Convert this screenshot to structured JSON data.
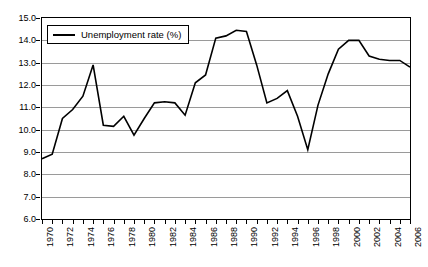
{
  "chart_data": {
    "type": "line",
    "title": "",
    "xlabel": "",
    "ylabel": "",
    "grid": true,
    "legend_position": "top-left",
    "xlim": [
      1970,
      2006
    ],
    "ylim": [
      6.0,
      15.0
    ],
    "ytick_labels": [
      "15.0",
      "14.0",
      "13.0",
      "12.0",
      "11.0",
      "10.0",
      "9.0",
      "8.0",
      "7.0",
      "6.0"
    ],
    "ytick_values": [
      15.0,
      14.0,
      13.0,
      12.0,
      11.0,
      10.0,
      9.0,
      8.0,
      7.0,
      6.0
    ],
    "xtick_labels": [
      "1970",
      "1972",
      "1974",
      "1976",
      "1978",
      "1980",
      "1982",
      "1984",
      "1986",
      "1988",
      "1990",
      "1992",
      "1994",
      "1996",
      "1998",
      "2000",
      "2002",
      "2004",
      "2006"
    ],
    "xtick_values": [
      1970,
      1972,
      1974,
      1976,
      1978,
      1980,
      1982,
      1984,
      1986,
      1988,
      1990,
      1992,
      1994,
      1996,
      1998,
      2000,
      2002,
      2004,
      2006
    ],
    "x": [
      1970,
      1971,
      1972,
      1973,
      1974,
      1975,
      1976,
      1977,
      1978,
      1979,
      1980,
      1981,
      1982,
      1983,
      1984,
      1985,
      1986,
      1987,
      1988,
      1989,
      1990,
      1991,
      1992,
      1993,
      1994,
      1995,
      1996,
      1997,
      1998,
      1999,
      2000,
      2001,
      2002,
      2003,
      2004,
      2005,
      2006
    ],
    "series": [
      {
        "name": "Unemployment rate (%)",
        "color": "#000000",
        "values": [
          8.7,
          8.9,
          10.5,
          10.9,
          11.5,
          12.9,
          10.2,
          10.15,
          10.6,
          9.75,
          10.5,
          11.2,
          11.25,
          11.2,
          10.65,
          12.1,
          12.45,
          14.1,
          14.2,
          14.45,
          14.4,
          12.9,
          11.2,
          11.4,
          11.75,
          10.6,
          9.1,
          11.1,
          12.5,
          13.6,
          14.0,
          14.0,
          13.3,
          13.15,
          13.1,
          13.1,
          12.8
        ]
      }
    ],
    "legend": [
      {
        "label": "Unemployment rate (%)",
        "color": "#000000",
        "marker": "line"
      }
    ],
    "colors": {
      "line": "#000000",
      "grid": "#9a9a9a",
      "axis": "#000000",
      "background": "#ffffff"
    }
  }
}
